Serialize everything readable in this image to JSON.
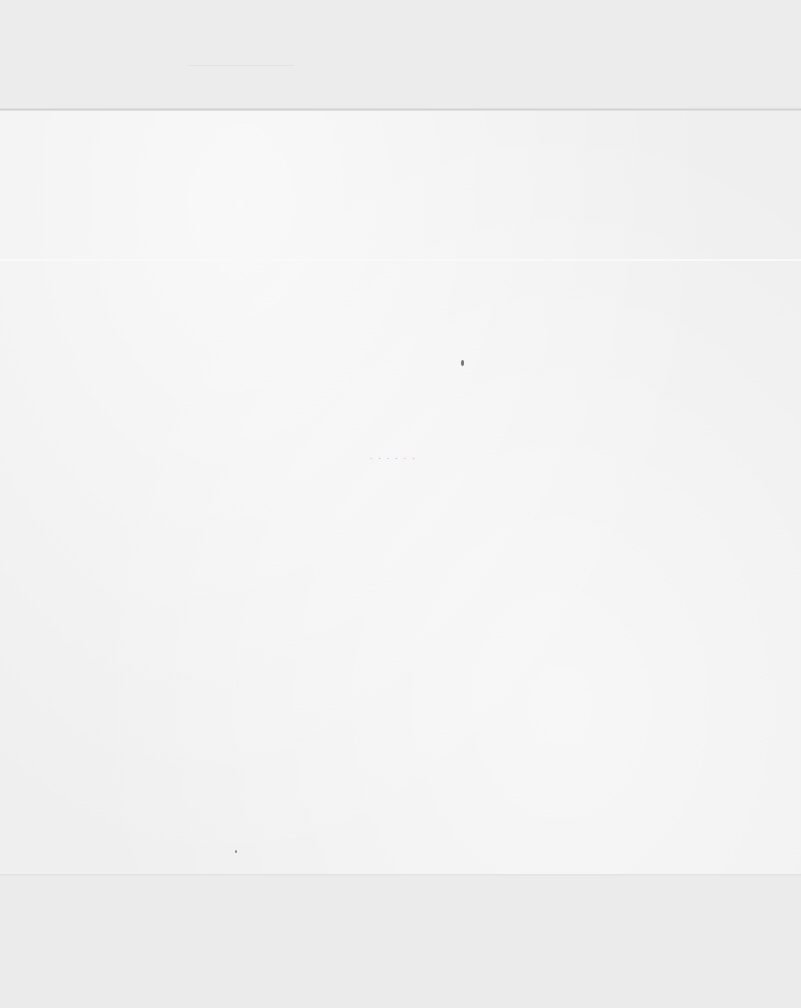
{
  "document": {
    "type": "blank scanned page",
    "text": "",
    "marks": {
      "dotted_specks": ". . . . . ."
    }
  }
}
